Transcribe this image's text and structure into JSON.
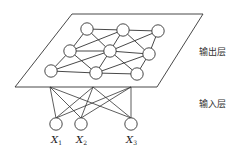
{
  "diagram": {
    "type": "self-organizing-map",
    "labels": {
      "output_layer": "输出层",
      "input_layer": "输入层"
    },
    "inputs": [
      {
        "name": "X",
        "sub": "1",
        "cx": 56,
        "cy": 124
      },
      {
        "name": "X",
        "sub": "2",
        "cx": 81,
        "cy": 124
      },
      {
        "name": "X",
        "sub": "3",
        "cx": 131,
        "cy": 124
      }
    ],
    "output_plane": {
      "points": "72,14 203,14 157,87 15,87"
    },
    "output_nodes": [
      {
        "id": "A",
        "cx": 87,
        "cy": 29
      },
      {
        "id": "B",
        "cx": 123,
        "cy": 30
      },
      {
        "id": "C",
        "cx": 158,
        "cy": 31
      },
      {
        "id": "D",
        "cx": 70,
        "cy": 51
      },
      {
        "id": "E",
        "cx": 110,
        "cy": 51
      },
      {
        "id": "F",
        "cx": 149,
        "cy": 54
      },
      {
        "id": "G",
        "cx": 51,
        "cy": 71
      },
      {
        "id": "H",
        "cx": 96,
        "cy": 73
      },
      {
        "id": "I",
        "cx": 137,
        "cy": 74
      }
    ],
    "output_edges": [
      [
        "A",
        "B"
      ],
      [
        "B",
        "C"
      ],
      [
        "A",
        "D"
      ],
      [
        "A",
        "E"
      ],
      [
        "D",
        "B"
      ],
      [
        "B",
        "E"
      ],
      [
        "B",
        "F"
      ],
      [
        "E",
        "C"
      ],
      [
        "C",
        "F"
      ],
      [
        "D",
        "E"
      ],
      [
        "E",
        "F"
      ],
      [
        "D",
        "G"
      ],
      [
        "G",
        "H"
      ],
      [
        "H",
        "I"
      ],
      [
        "G",
        "E"
      ],
      [
        "D",
        "H"
      ],
      [
        "E",
        "H"
      ],
      [
        "E",
        "I"
      ],
      [
        "H",
        "F"
      ],
      [
        "F",
        "I"
      ]
    ],
    "anchors": [
      {
        "x": 50,
        "y": 87
      },
      {
        "x": 93,
        "y": 87
      },
      {
        "x": 131,
        "y": 87
      }
    ],
    "colors": {
      "line": "#333333",
      "fill": "#ffffff"
    }
  }
}
